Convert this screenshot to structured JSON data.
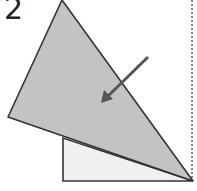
{
  "diagram": {
    "step_number": "2",
    "colors": {
      "folded_flap": "#c3c3c3",
      "under_paper": "#f0f0f0",
      "outline": "#333333",
      "arrow": "#555555",
      "dotted_line": "#333333"
    },
    "shapes": {
      "folded_flap": "62,0 8,117 193,181",
      "under_paper": "63,138 63,181 193,181",
      "arrow": {
        "from": [
          148,
          57
        ],
        "to": [
          101,
          103
        ]
      },
      "dotted_line": {
        "x": 192,
        "y1": 0,
        "y2": 181
      }
    }
  }
}
